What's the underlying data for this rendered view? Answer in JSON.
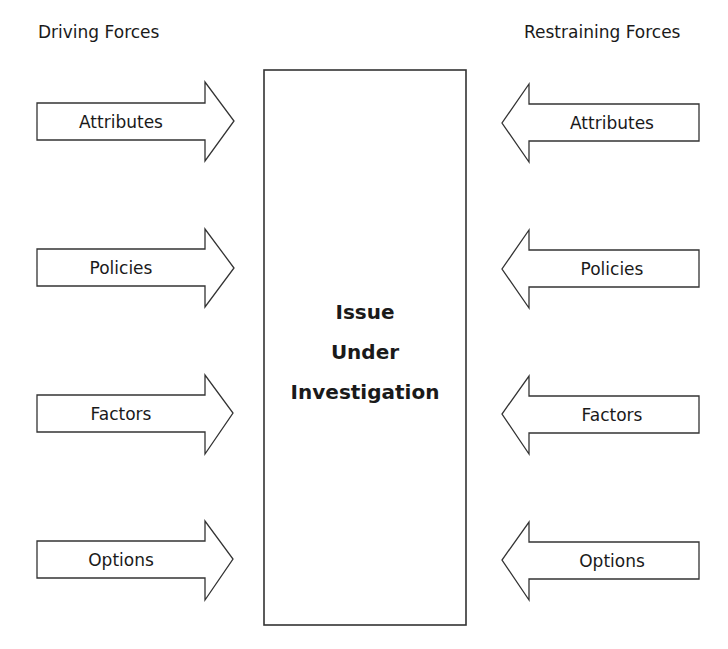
{
  "diagram": {
    "left_heading": "Driving Forces",
    "right_heading": "Restraining Forces",
    "center": {
      "lines": [
        "Issue",
        "Under",
        "Investigation"
      ]
    },
    "driving_forces": [
      {
        "label": "Attributes"
      },
      {
        "label": "Policies"
      },
      {
        "label": "Factors"
      },
      {
        "label": "Options"
      }
    ],
    "restraining_forces": [
      {
        "label": "Attributes"
      },
      {
        "label": "Policies"
      },
      {
        "label": "Factors"
      },
      {
        "label": "Options"
      }
    ],
    "colors": {
      "stroke": "#333333",
      "fill": "#ffffff",
      "text": "#1a1a1a"
    }
  }
}
